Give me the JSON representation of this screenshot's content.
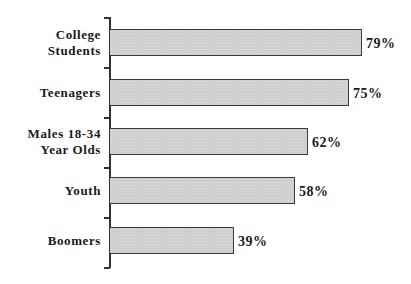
{
  "chart_data": {
    "type": "bar",
    "orientation": "horizontal",
    "title": "",
    "xlabel": "",
    "ylabel": "",
    "categories": [
      "College\nStudents",
      "Teenagers",
      "Males 18-34\nYear Olds",
      "Youth",
      "Boomers"
    ],
    "values": [
      79,
      75,
      62,
      58,
      39
    ],
    "value_labels": [
      "79%",
      "75%",
      "62%",
      "58%",
      "39%"
    ],
    "xlim": [
      0,
      100
    ],
    "grid": false,
    "legend": null,
    "bar_color": "#cfcfcf",
    "bar_edge_color": "#3a3a3a"
  },
  "layout": {
    "axis_x": 110,
    "axis_top": 17,
    "slot_height": 50,
    "bar_tops": [
      29,
      79,
      128,
      177,
      227
    ],
    "bar_height": 27,
    "px_per_percent": 3.19
  }
}
